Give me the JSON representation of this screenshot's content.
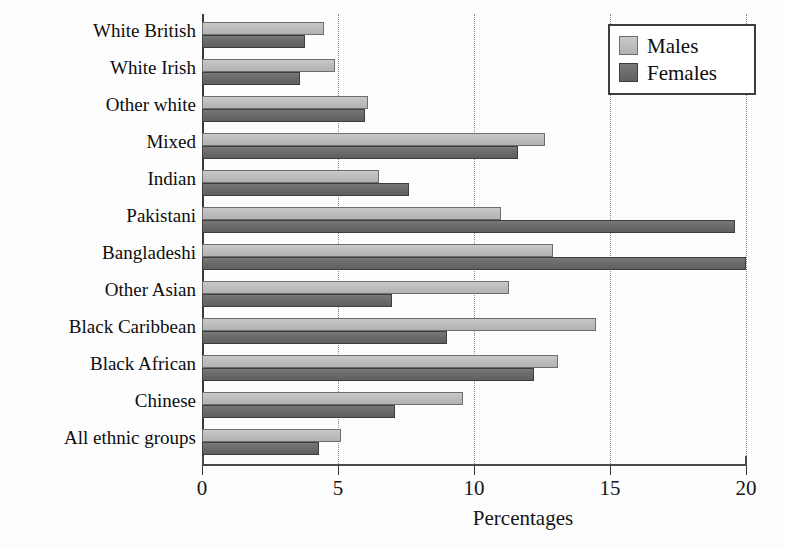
{
  "chart_data": {
    "type": "bar",
    "orientation": "horizontal",
    "title": "",
    "xlabel": "Percentages",
    "ylabel": "",
    "xlim": [
      0,
      20
    ],
    "xticks": [
      0,
      5,
      10,
      15,
      20
    ],
    "xtick_labels": [
      "0",
      "5",
      "10",
      "15",
      "20"
    ],
    "grid": "vertical dotted gridlines at each x tick",
    "legend_position": "top-right inside plot",
    "categories": [
      "White British",
      "White Irish",
      "Other white",
      "Mixed",
      "Indian",
      "Pakistani",
      "Bangladeshi",
      "Other Asian",
      "Black Caribbean",
      "Black African",
      "Chinese",
      "All ethnic groups"
    ],
    "series": [
      {
        "name": "Males",
        "color": "#bdbdbd",
        "values": [
          4.5,
          4.9,
          6.1,
          12.6,
          6.5,
          11.0,
          12.9,
          11.3,
          14.5,
          13.1,
          9.6,
          5.1
        ]
      },
      {
        "name": "Females",
        "color": "#6b6b6b",
        "values": [
          3.8,
          3.6,
          6.0,
          11.6,
          7.6,
          19.6,
          20.0,
          7.0,
          9.0,
          12.2,
          7.1,
          4.3
        ]
      }
    ]
  },
  "legend": {
    "items": [
      {
        "label": "Males"
      },
      {
        "label": "Females"
      }
    ]
  },
  "axis": {
    "x_title": "Percentages"
  }
}
